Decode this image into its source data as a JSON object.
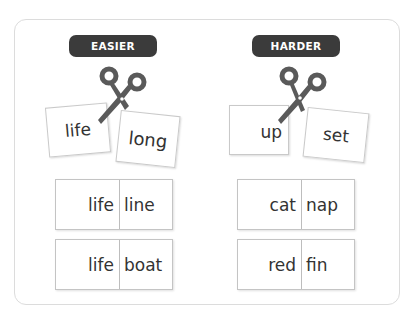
{
  "colors": {
    "badge_bg": "#3b3b3b",
    "scissors": "#5a5a5a",
    "card_border": "#c9c9c9",
    "frame_border": "#dcdcdc"
  },
  "easier": {
    "label": "EASIER",
    "cut_word": {
      "left": "life",
      "right": "long"
    },
    "pairs": [
      {
        "left": "life",
        "right": "line"
      },
      {
        "left": "life",
        "right": "boat"
      }
    ]
  },
  "harder": {
    "label": "HARDER",
    "cut_word": {
      "left": "up",
      "right": "set"
    },
    "pairs": [
      {
        "left": "cat",
        "right": "nap"
      },
      {
        "left": "red",
        "right": "fin"
      }
    ]
  },
  "icons": {
    "scissors": "scissors-icon"
  }
}
